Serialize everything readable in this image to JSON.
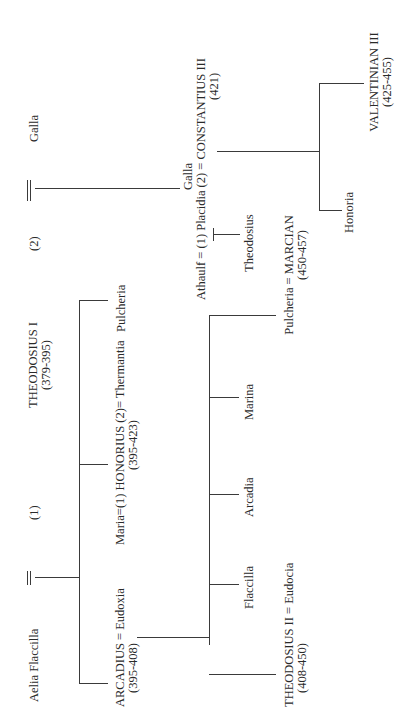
{
  "diagram": {
    "type": "family-tree",
    "orientation": "rotated-90-ccw",
    "generation_1": {
      "wife_1": "Aelia Flaccilla",
      "marker_1": "(1)",
      "emperor": "THEODOSIUS I",
      "emperor_reign": "(379-395)",
      "marker_2": "(2)",
      "wife_2": "Galla"
    },
    "generation_2": {
      "arcadius": "ARCADIUS = Eudoxia",
      "arcadius_reign": "(395-408)",
      "honorius": "Maria=(1) HONORIUS (2)= Thermantia",
      "honorius_reign": "(395-423)",
      "pulcheria": "Pulcheria",
      "galla_placidia_top": "Galla",
      "galla_placidia": "Athaulf = (1)  Placidia (2) = CONSTANTIUS III",
      "constantius_reign": "(421)"
    },
    "generation_3": {
      "theodosius_ii": "THEODOSIUS II = Eudocia",
      "theodosius_ii_reign": "(408-450)",
      "flaccilla": "Flaccilla",
      "arcadia": "Arcadia",
      "marina": "Marina",
      "pulcheria_marcian": "Pulcheria = MARCIAN",
      "marcian_reign": "(450-457)",
      "theodosius_child": "Theodosius",
      "honoria": "Honoria",
      "valentinian": "VALENTINIAN III",
      "valentinian_reign": "(425-455)"
    }
  }
}
